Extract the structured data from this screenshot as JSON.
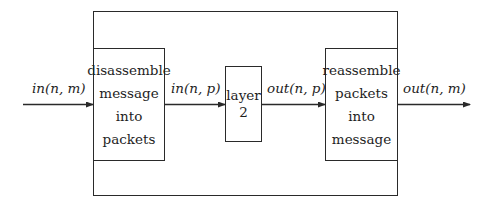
{
  "diagram": {
    "outer_container": "system",
    "blocks": [
      {
        "id": "disassemble",
        "lines": [
          "disassemble",
          "message",
          "into",
          "packets"
        ]
      },
      {
        "id": "layer2",
        "lines": [
          "layer",
          "2"
        ]
      },
      {
        "id": "reassemble",
        "lines": [
          "reassemble",
          "packets",
          "into",
          "message"
        ]
      }
    ],
    "edges": [
      {
        "from": "input",
        "to": "disassemble",
        "label": "in(n, m)"
      },
      {
        "from": "disassemble",
        "to": "layer2",
        "label": "in(n, p)"
      },
      {
        "from": "layer2",
        "to": "reassemble",
        "label": "out(n, p)"
      },
      {
        "from": "reassemble",
        "to": "output",
        "label": "out(n, m)"
      }
    ],
    "colors": {
      "stroke": "#2a2a2a",
      "text": "#1e1e1e",
      "background": "#ffffff"
    }
  }
}
